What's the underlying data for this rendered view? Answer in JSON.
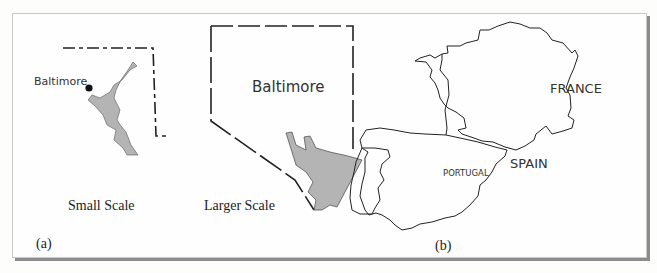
{
  "figure": {
    "panel_a": {
      "label": "(a)",
      "small_map": {
        "city_label": "Baltimore",
        "caption": "Small Scale"
      },
      "large_map": {
        "city_label": "Baltimore",
        "caption": "Larger Scale"
      }
    },
    "panel_b": {
      "label": "(b)",
      "countries": [
        "FRANCE",
        "SPAIN",
        "PORTUGAL"
      ]
    }
  },
  "colors": {
    "water": "#b4b4b4",
    "outline": "#222222",
    "frame_shadow": "#8c8c8c"
  }
}
